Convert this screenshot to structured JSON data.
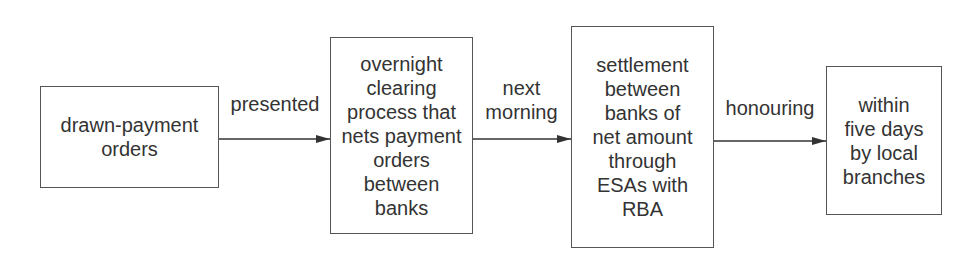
{
  "diagram": {
    "type": "flowchart",
    "direction": "left-to-right",
    "nodes": [
      {
        "id": "n1",
        "label": "drawn-payment\norders"
      },
      {
        "id": "n2",
        "label": "overnight\nclearing\nprocess that\nnets payment\norders\nbetween\nbanks"
      },
      {
        "id": "n3",
        "label": "settlement\nbetween\nbanks of\nnet amount\nthrough\nESAs with\nRBA"
      },
      {
        "id": "n4",
        "label": "within\nfive days\nby local\nbranches"
      }
    ],
    "edges": [
      {
        "from": "n1",
        "to": "n2",
        "label": "presented"
      },
      {
        "from": "n2",
        "to": "n3",
        "label": "next\nmorning"
      },
      {
        "from": "n3",
        "to": "n4",
        "label": "honouring"
      }
    ]
  }
}
